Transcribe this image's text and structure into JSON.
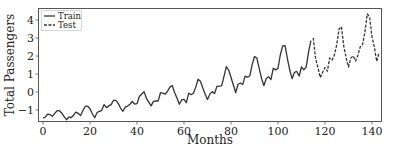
{
  "chart_data": {
    "type": "line",
    "title": "",
    "xlabel": "Months",
    "ylabel": "Total Passengers",
    "xlim": [
      0,
      144
    ],
    "ylim": [
      -1.6,
      4.7
    ],
    "xticks": [
      0,
      20,
      40,
      60,
      80,
      100,
      120,
      140
    ],
    "yticks": [
      -1,
      0,
      1,
      2,
      3,
      4
    ],
    "grid": false,
    "legend_position": "upper left",
    "legend": [
      "Train",
      "Test"
    ],
    "series": [
      {
        "name": "Train",
        "style": "solid",
        "x_start": 0,
        "values": [
          -1.45,
          -1.39,
          -1.23,
          -1.26,
          -1.35,
          -1.19,
          -1.04,
          -1.04,
          -1.18,
          -1.37,
          -1.54,
          -1.39,
          -1.42,
          -1.29,
          -1.12,
          -1.19,
          -1.31,
          -1.03,
          -0.79,
          -0.79,
          -0.93,
          -1.21,
          -1.43,
          -1.14,
          -1.08,
          -1.02,
          -0.7,
          -0.87,
          -0.77,
          -0.7,
          -0.46,
          -0.46,
          -0.63,
          -0.89,
          -1.07,
          -0.84,
          -0.78,
          -0.68,
          -0.53,
          -0.67,
          -0.65,
          -0.25,
          -0.11,
          0.02,
          -0.35,
          -0.56,
          -0.77,
          -0.52,
          -0.5,
          -0.5,
          -0.04,
          -0.06,
          -0.12,
          0.04,
          0.27,
          0.36,
          -0.03,
          -0.33,
          -0.68,
          -0.44,
          -0.41,
          -0.59,
          -0.06,
          -0.15,
          -0.07,
          0.27,
          0.71,
          0.6,
          0.22,
          -0.12,
          -0.42,
          -0.12,
          0.02,
          -0.08,
          0.31,
          0.33,
          0.34,
          0.85,
          1.41,
          1.22,
          0.82,
          0.39,
          -0.03,
          0.43,
          0.5,
          0.42,
          0.88,
          0.83,
          0.89,
          1.52,
          1.97,
          1.88,
          1.31,
          0.75,
          0.35,
          0.75,
          0.85,
          0.69,
          1.32,
          1.23,
          1.31,
          2.07,
          2.56,
          2.58,
          1.86,
          1.22,
          0.74,
          1.09,
          1.14,
          0.89,
          1.39,
          1.23,
          1.4,
          2.22,
          2.85
        ]
      },
      {
        "name": "Test",
        "style": "dashed",
        "x_start": 115,
        "values": [
          3.01,
          1.86,
          1.35,
          0.8,
          1.1,
          1.36,
          1.16,
          1.89,
          1.77,
          2.05,
          2.64,
          3.5,
          3.63,
          2.54,
          1.9,
          1.39,
          1.88,
          2.01,
          1.72,
          2.04,
          2.51,
          2.64,
          3.35,
          4.34,
          4.16,
          3.05,
          2.51,
          1.7,
          2.18
        ]
      }
    ]
  }
}
